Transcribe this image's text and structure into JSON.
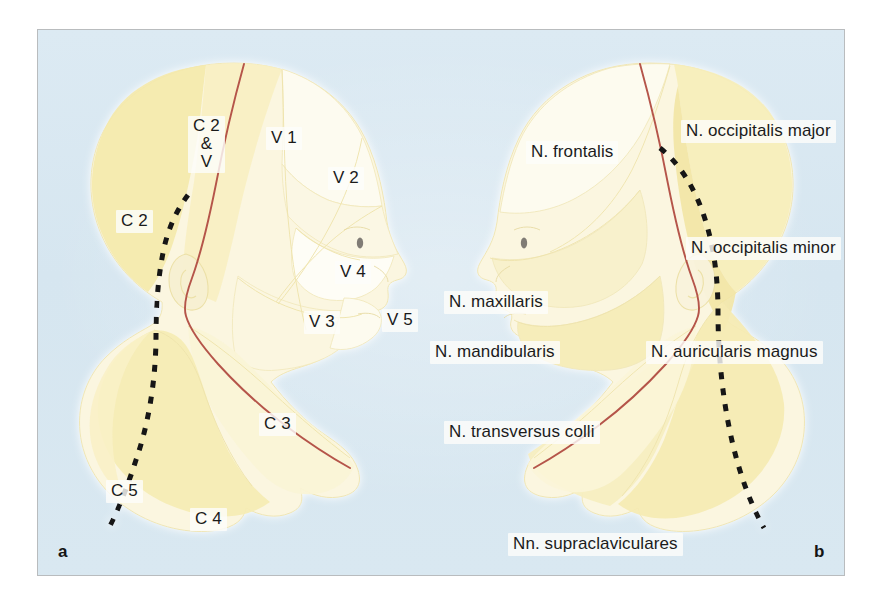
{
  "figure": {
    "background_color": "#d6e6f0",
    "frame_border_color": "#b9bcbe",
    "skin_fill_light": "#fbf7e2",
    "skin_fill_mid": "#f7efc8",
    "skin_fill_deep": "#f2e6a8",
    "outline_color": "#e9dfa8",
    "red_line_color": "#b5544a",
    "dashed_line_color": "#141414",
    "text_color": "#1b1b1b",
    "label_chip_color": "#fdfdfa"
  },
  "panels": [
    {
      "id": "a",
      "letter": "a",
      "caption": "Segmental / dermatomal innervation of head and neck"
    },
    {
      "id": "b",
      "letter": "b",
      "caption": "Peripheral cutaneous nerve territories of head and neck"
    }
  ],
  "panel_a": {
    "letter": "a",
    "labels": [
      {
        "name": "dermatome-c2-and-v",
        "text": "C 2\n&\nV",
        "lines": [
          "C 2",
          "&",
          "V"
        ],
        "x": 150,
        "y": 86
      },
      {
        "name": "dermatome-c2",
        "text": "C 2",
        "x": 78,
        "y": 180
      },
      {
        "name": "dermatome-v1",
        "text": "V 1",
        "x": 228,
        "y": 97
      },
      {
        "name": "dermatome-v2",
        "text": "V 2",
        "x": 290,
        "y": 137
      },
      {
        "name": "dermatome-v4",
        "text": "V 4",
        "x": 297,
        "y": 231
      },
      {
        "name": "dermatome-v3",
        "text": "V 3",
        "x": 266,
        "y": 281
      },
      {
        "name": "dermatome-v5",
        "text": "V 5",
        "x": 344,
        "y": 279
      },
      {
        "name": "dermatome-c3",
        "text": "C 3",
        "x": 221,
        "y": 383
      },
      {
        "name": "dermatome-c5",
        "text": "C 5",
        "x": 68,
        "y": 450
      },
      {
        "name": "dermatome-c4",
        "text": "C 4",
        "x": 152,
        "y": 478
      }
    ]
  },
  "panel_b": {
    "letter": "b",
    "labels": [
      {
        "name": "nerve-frontalis",
        "text": "N. frontalis",
        "x": 488,
        "y": 111
      },
      {
        "name": "nerve-occipitalis-major",
        "text": "N. occipitalis major",
        "x": 643,
        "y": 90
      },
      {
        "name": "nerve-occipitalis-minor",
        "text": "N. occipitalis minor",
        "x": 648,
        "y": 207
      },
      {
        "name": "nerve-maxillaris",
        "text": "N. maxillaris",
        "x": 406,
        "y": 261
      },
      {
        "name": "nerve-mandibularis",
        "text": "N. mandibularis",
        "x": 392,
        "y": 311
      },
      {
        "name": "nerve-auricularis-magnus",
        "text": "N. auricularis magnus",
        "x": 608,
        "y": 311
      },
      {
        "name": "nerve-transversus-colli",
        "text": "N. transversus colli",
        "x": 406,
        "y": 391
      },
      {
        "name": "nerve-supraclaviculares",
        "text": "Nn. supraclaviculares",
        "x": 470,
        "y": 503
      }
    ]
  }
}
